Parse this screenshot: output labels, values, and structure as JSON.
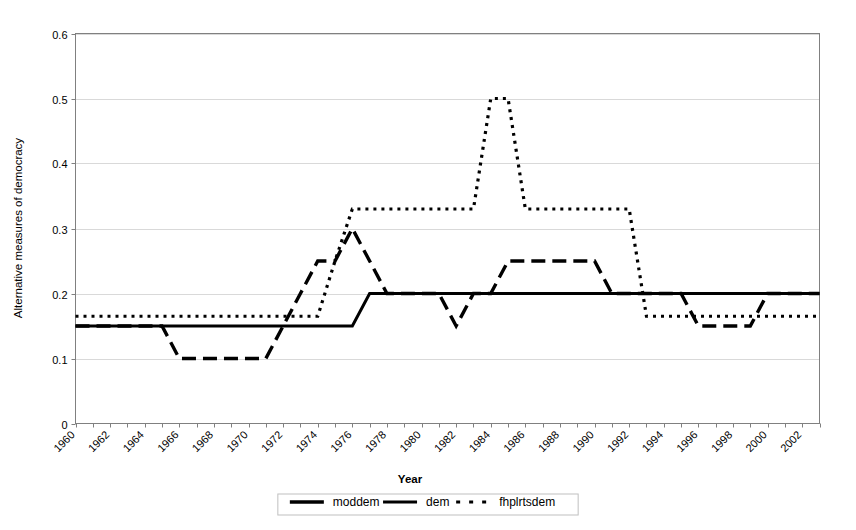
{
  "chart_data": {
    "type": "line",
    "title": "",
    "xlabel": "Year",
    "ylabel": "Alternative measures of democracy",
    "xlim": [
      1960,
      2003
    ],
    "ylim": [
      0,
      0.6
    ],
    "grid": true,
    "legend_position": "bottom",
    "y_ticks": [
      "0",
      "0.1",
      "0.2",
      "0.3",
      "0.4",
      "0.5",
      "0.6"
    ],
    "y_tick_values": [
      0,
      0.1,
      0.2,
      0.3,
      0.4,
      0.5,
      0.6
    ],
    "x_ticks": [
      "1960",
      "1962",
      "1964",
      "1966",
      "1968",
      "1970",
      "1972",
      "1974",
      "1976",
      "1978",
      "1980",
      "1982",
      "1984",
      "1986",
      "1988",
      "1990",
      "1992",
      "1994",
      "1996",
      "1998",
      "2000",
      "2002"
    ],
    "x_tick_values": [
      1960,
      1962,
      1964,
      1966,
      1968,
      1970,
      1972,
      1974,
      1976,
      1978,
      1980,
      1982,
      1984,
      1986,
      1988,
      1990,
      1992,
      1994,
      1996,
      1998,
      2000,
      2002
    ],
    "x": [
      1960,
      1961,
      1962,
      1963,
      1964,
      1965,
      1966,
      1967,
      1968,
      1969,
      1970,
      1971,
      1972,
      1973,
      1974,
      1975,
      1976,
      1977,
      1978,
      1979,
      1980,
      1981,
      1982,
      1983,
      1984,
      1985,
      1986,
      1987,
      1988,
      1989,
      1990,
      1991,
      1992,
      1993,
      1994,
      1995,
      1996,
      1997,
      1998,
      1999,
      2000,
      2001,
      2002,
      2003
    ],
    "series": [
      {
        "name": "moddem",
        "style": "dashed",
        "color": "#000000",
        "values": [
          0.15,
          0.15,
          0.15,
          0.15,
          0.15,
          0.15,
          0.1,
          0.1,
          0.1,
          0.1,
          0.1,
          0.1,
          0.15,
          0.2,
          0.25,
          0.25,
          0.3,
          0.25,
          0.2,
          0.2,
          0.2,
          0.2,
          0.15,
          0.2,
          0.2,
          0.25,
          0.25,
          0.25,
          0.25,
          0.25,
          0.25,
          0.2,
          0.2,
          0.2,
          0.2,
          0.2,
          0.15,
          0.15,
          0.15,
          0.15,
          0.2,
          0.2,
          0.2,
          0.2
        ]
      },
      {
        "name": "dem",
        "style": "solid",
        "color": "#000000",
        "values": [
          0.15,
          0.15,
          0.15,
          0.15,
          0.15,
          0.15,
          0.15,
          0.15,
          0.15,
          0.15,
          0.15,
          0.15,
          0.15,
          0.15,
          0.15,
          0.15,
          0.15,
          0.2,
          0.2,
          0.2,
          0.2,
          0.2,
          0.2,
          0.2,
          0.2,
          0.2,
          0.2,
          0.2,
          0.2,
          0.2,
          0.2,
          0.2,
          0.2,
          0.2,
          0.2,
          0.2,
          0.2,
          0.2,
          0.2,
          0.2,
          0.2,
          0.2,
          0.2,
          0.2
        ]
      },
      {
        "name": "fhplrtsdem",
        "style": "dotted",
        "color": "#000000",
        "values": [
          0.165,
          0.165,
          0.165,
          0.165,
          0.165,
          0.165,
          0.165,
          0.165,
          0.165,
          0.165,
          0.165,
          0.165,
          0.165,
          0.165,
          0.165,
          0.25,
          0.33,
          0.33,
          0.33,
          0.33,
          0.33,
          0.33,
          0.33,
          0.33,
          0.5,
          0.5,
          0.33,
          0.33,
          0.33,
          0.33,
          0.33,
          0.33,
          0.33,
          0.165,
          0.165,
          0.165,
          0.165,
          0.165,
          0.165,
          0.165,
          0.165,
          0.165,
          0.165,
          0.165
        ]
      }
    ],
    "legend_entries": [
      {
        "label": "moddem",
        "style": "dashed"
      },
      {
        "label": "dem",
        "style": "solid"
      },
      {
        "label": "fhplrtsdem",
        "style": "dotted"
      }
    ]
  }
}
